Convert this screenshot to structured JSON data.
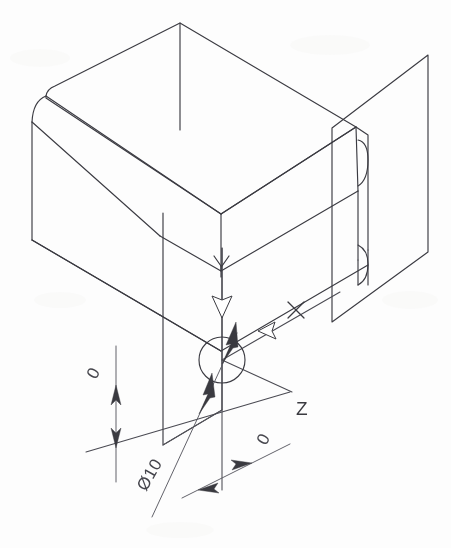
{
  "document": {
    "kind": "isometric-technical-drawing",
    "title": "Isometric box with through hole",
    "background_color": "#fdfdfd",
    "line_color": "#3b3b42",
    "width": 451,
    "height": 548
  },
  "axes": {
    "items": [
      {
        "id": "y-axis",
        "label": "Y",
        "label_x": 221,
        "label_y": 268,
        "direction": "vertical-down",
        "arrow_x": 222,
        "arrow_y": 308
      },
      {
        "id": "x-axis",
        "label": "X",
        "label_x": 295,
        "label_y": 318,
        "direction": "left-down-to-origin",
        "arrow_x": 268,
        "arrow_y": 327
      },
      {
        "id": "z-axis",
        "label": "Z",
        "label_x": 296,
        "label_y": 415,
        "direction": "lower-right",
        "arrow_x": 210,
        "arrow_y": 395
      }
    ]
  },
  "hole": {
    "name": "through-hole",
    "center_x": 222,
    "center_y": 360,
    "radius": 23,
    "callout": "Ø10",
    "callout_x": 146,
    "callout_y": 488,
    "callout_rotation": -60
  },
  "dimensions": [
    {
      "id": "dim-left-vertical",
      "value": "0",
      "text_x": 100,
      "text_y": 375,
      "rotation": -62,
      "orientation": "vertical",
      "line_x1": 116,
      "line_y1": 350,
      "line_x2": 116,
      "line_y2": 480
    },
    {
      "id": "dim-bottom-inclined",
      "value": "0",
      "text_x": 268,
      "text_y": 443,
      "rotation": -62,
      "orientation": "inclined",
      "line_x1": 186,
      "line_y1": 495,
      "line_x2": 288,
      "line_y2": 444
    }
  ],
  "geometry": {
    "solid_name": "rectangular-block",
    "has_fillet_left": true,
    "has_fillet_right": true,
    "back_plane_name": "reference-plane-right",
    "front_plane_name": "reference-plane-front"
  },
  "callouts": {
    "diameter_symbol": "Ø",
    "diameter_value": "10"
  }
}
